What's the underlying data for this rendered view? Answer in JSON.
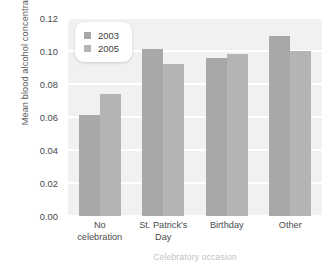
{
  "chart_data": {
    "type": "bar",
    "title": "",
    "xlabel": "Celebratory occasion",
    "ylabel": "Mean blood alcohol concentration",
    "categories": [
      "No celebration",
      "St. Patrick's Day",
      "Birthday",
      "Other"
    ],
    "category_lines": [
      [
        "No",
        "celebration"
      ],
      [
        "St. Patrick's",
        "Day"
      ],
      [
        "Birthday"
      ],
      [
        "Other"
      ]
    ],
    "series": [
      {
        "name": "2003",
        "color": "#a8a8a8",
        "values": [
          0.061,
          0.101,
          0.096,
          0.109
        ]
      },
      {
        "name": "2005",
        "color": "#b4b4b4",
        "values": [
          0.074,
          0.092,
          0.098,
          0.1
        ]
      }
    ],
    "ylim": [
      0.0,
      0.12
    ],
    "ytick_labels": [
      "0.00",
      "0.02",
      "0.04",
      "0.06",
      "0.08",
      "0.10",
      "0.12"
    ],
    "ytick_values": [
      0.0,
      0.02,
      0.04,
      0.06,
      0.08,
      0.1,
      0.12
    ],
    "grid": true,
    "grid_color": "#ffffff",
    "plot_background": "#f1f1f1",
    "legend_position": "upper left",
    "legend_entries": [
      "2003",
      "2005"
    ]
  }
}
